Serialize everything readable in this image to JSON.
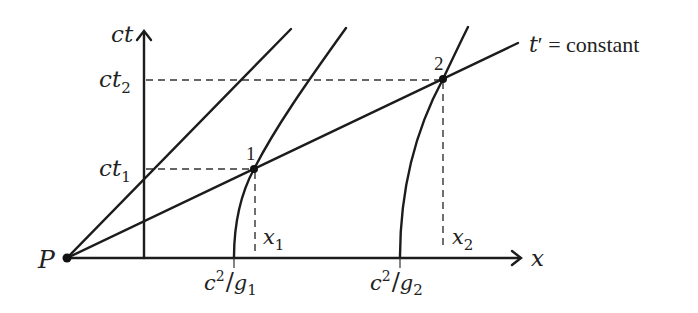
{
  "diagram": {
    "type": "spacetime-diagram",
    "axes": {
      "x_label": "x",
      "y_label": "ct"
    },
    "origin_label": "P",
    "y_ticks": [
      {
        "label_base": "ct",
        "label_sub": "1"
      },
      {
        "label_base": "ct",
        "label_sub": "2"
      }
    ],
    "x_ticks": [
      {
        "label_base": "x",
        "label_sub": "1"
      },
      {
        "label_base": "x",
        "label_sub": "2"
      }
    ],
    "worldline_starts": [
      {
        "num": "c",
        "sup": "2",
        "slash": "/",
        "den": "g",
        "sub": "1"
      },
      {
        "num": "c",
        "sup": "2",
        "slash": "/",
        "den": "g",
        "sub": "2"
      }
    ],
    "events": [
      {
        "label": "1"
      },
      {
        "label": "2"
      }
    ],
    "line_label": {
      "var": "t",
      "prime": "′",
      "rest": " = constant"
    }
  }
}
